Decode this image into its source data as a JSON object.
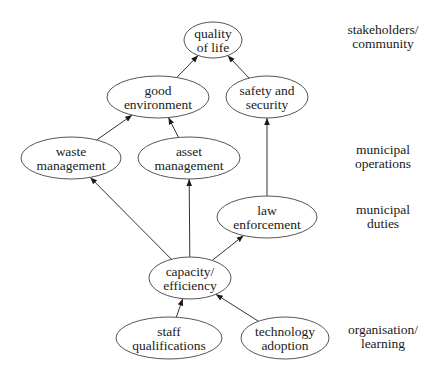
{
  "nodes": [
    {
      "id": "quality",
      "lines": [
        "quality",
        "of life"
      ],
      "cx": 213,
      "cy": 40,
      "rx": 29,
      "ry": 18
    },
    {
      "id": "good_env",
      "lines": [
        "good",
        "environment"
      ],
      "cx": 158,
      "cy": 97,
      "rx": 51,
      "ry": 21
    },
    {
      "id": "safety",
      "lines": [
        "safety and",
        "security"
      ],
      "cx": 267,
      "cy": 97,
      "rx": 41,
      "ry": 21
    },
    {
      "id": "waste",
      "lines": [
        "waste",
        "management"
      ],
      "cx": 71,
      "cy": 158,
      "rx": 50,
      "ry": 21
    },
    {
      "id": "asset",
      "lines": [
        "asset",
        "management"
      ],
      "cx": 189,
      "cy": 158,
      "rx": 51,
      "ry": 21
    },
    {
      "id": "law",
      "lines": [
        "law",
        "enforcement"
      ],
      "cx": 267,
      "cy": 217,
      "rx": 50,
      "ry": 21
    },
    {
      "id": "capacity",
      "lines": [
        "capacity/",
        "efficiency"
      ],
      "cx": 190,
      "cy": 278,
      "rx": 41,
      "ry": 21
    },
    {
      "id": "staff",
      "lines": [
        "staff",
        "qualifications"
      ],
      "cx": 169,
      "cy": 338,
      "rx": 53,
      "ry": 21
    },
    {
      "id": "tech",
      "lines": [
        "technology",
        "adoption"
      ],
      "cx": 285,
      "cy": 338,
      "rx": 44,
      "ry": 21
    }
  ],
  "edges": [
    {
      "from": "good_env",
      "to": "quality"
    },
    {
      "from": "safety",
      "to": "quality"
    },
    {
      "from": "waste",
      "to": "good_env"
    },
    {
      "from": "asset",
      "to": "good_env"
    },
    {
      "from": "law",
      "to": "safety"
    },
    {
      "from": "capacity",
      "to": "waste"
    },
    {
      "from": "capacity",
      "to": "asset"
    },
    {
      "from": "capacity",
      "to": "law"
    },
    {
      "from": "staff",
      "to": "capacity"
    },
    {
      "from": "tech",
      "to": "capacity"
    }
  ],
  "tiers": [
    {
      "lines": [
        "stakeholders/",
        "community"
      ],
      "x": 383,
      "y": 36
    },
    {
      "lines": [
        "municipal",
        "operations"
      ],
      "x": 383,
      "y": 156
    },
    {
      "lines": [
        "municipal",
        "duties"
      ],
      "x": 383,
      "y": 216
    },
    {
      "lines": [
        "organisation/",
        "learning"
      ],
      "x": 383,
      "y": 336
    }
  ],
  "colors": {
    "stroke": "#555555",
    "edge": "#333333",
    "text": "#1a1a1a",
    "background": "#ffffff"
  }
}
